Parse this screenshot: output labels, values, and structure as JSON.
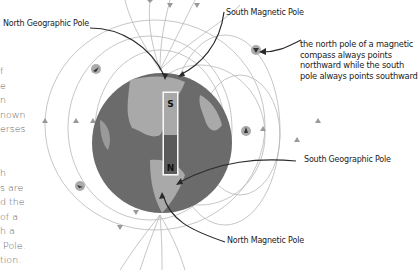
{
  "labels": {
    "north_geographic_pole": "North Geographic Pole",
    "south_magnetic_pole": "South Magnetic Pole",
    "south_geographic_pole": "South Geographic Pole",
    "north_magnetic_pole": "North Magnetic Pole",
    "compass_note": "the north pole of a magnetic\ncompass always points\nnorthward while the south\npole always points southward"
  },
  "magnet": {
    "top_letter": "S",
    "bottom_letter": "N"
  },
  "side_text": {
    "top": "f\ne\nn\nnown\nerses",
    "bottom": "h\ns are\nd the\nof a\nh a\n Pole.\ntion."
  },
  "colors": {
    "ocean": "#6b6b6b",
    "land": "#a9a9a9",
    "field_lines": "#b4b4b4",
    "pointer": "#2a2a2a",
    "compass": "#9a9a9a"
  }
}
